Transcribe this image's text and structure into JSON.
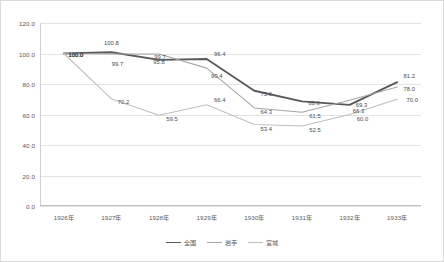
{
  "chart_data": {
    "type": "line",
    "title": "",
    "xlabel": "",
    "ylabel": "",
    "ylim": [
      0,
      120
    ],
    "ytick_step": 20,
    "grid": true,
    "legend_position": "bottom",
    "categories": [
      "1926年",
      "1927年",
      "1928年",
      "1929年",
      "1930年",
      "1931年",
      "1932年",
      "1933年"
    ],
    "ytick_labels": [
      "0.0",
      "20.0",
      "40.0",
      "60.0",
      "80.0",
      "100.0",
      "120.0"
    ],
    "series": [
      {
        "name": "全国",
        "color": "#595959",
        "width": 1.9,
        "values": [
          100.0,
          100.8,
          95.8,
          96.4,
          75.6,
          68.6,
          66.3,
          81.2
        ],
        "labels": [
          "100.0",
          "100.8",
          "95.8",
          "96.4",
          "75.6",
          "68.6",
          "66.3",
          "81.2"
        ]
      },
      {
        "name": "岩手",
        "color": "#a6a6a6",
        "width": 1.1,
        "values": [
          100.0,
          99.7,
          99.7,
          90.4,
          64.3,
          61.5,
          69.3,
          78.0
        ],
        "labels": [
          "100.0",
          "99.7",
          "99.7",
          "90.4",
          "64.3",
          "61.5",
          "69.3",
          "78.0"
        ]
      },
      {
        "name": "宮城",
        "color": "#bfbfbf",
        "width": 1.1,
        "values": [
          100.0,
          70.2,
          59.5,
          66.4,
          53.4,
          52.5,
          60.0,
          70.0
        ],
        "labels": [
          "100.0",
          "70.2",
          "59.5",
          "66.4",
          "53.4",
          "52.5",
          "60.0",
          "70.0"
        ]
      }
    ]
  },
  "legend": {
    "items": [
      {
        "label": "全国"
      },
      {
        "label": "岩手"
      },
      {
        "label": "宮城"
      }
    ]
  }
}
